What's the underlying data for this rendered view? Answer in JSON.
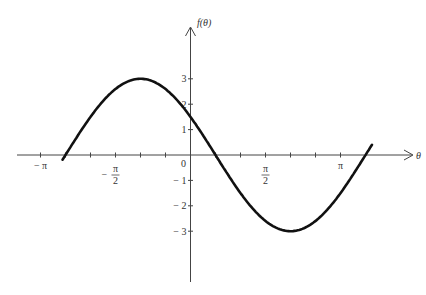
{
  "chart_data": {
    "type": "line",
    "title": "",
    "function": "f(θ) = 3cos(θ + π/3)",
    "xlabel": "θ",
    "ylabel": "f(θ)",
    "x_ticks": [
      {
        "value": -3.14159,
        "label": "−π"
      },
      {
        "value": -2.61799,
        "label": ""
      },
      {
        "value": -2.0944,
        "label": ""
      },
      {
        "value": -1.5708,
        "label": "−π/2"
      },
      {
        "value": -1.0472,
        "label": ""
      },
      {
        "value": -0.5236,
        "label": ""
      },
      {
        "value": 0.5236,
        "label": ""
      },
      {
        "value": 1.0472,
        "label": ""
      },
      {
        "value": 1.5708,
        "label": "π/2"
      },
      {
        "value": 2.0944,
        "label": ""
      },
      {
        "value": 2.61799,
        "label": ""
      },
      {
        "value": 3.14159,
        "label": "π"
      }
    ],
    "y_ticks": [
      {
        "value": 3,
        "label": "3"
      },
      {
        "value": 2,
        "label": "2"
      },
      {
        "value": 1,
        "label": "1"
      },
      {
        "value": -1,
        "label": "−1"
      },
      {
        "value": -2,
        "label": "−2"
      },
      {
        "value": -3,
        "label": "−3"
      }
    ],
    "origin_label": "0",
    "series": [
      {
        "name": "f(θ)",
        "amplitude": 3,
        "phase": 1.0472,
        "x_range": [
          -2.68,
          3.8
        ],
        "key_points": [
          {
            "x": -2.618,
            "y": 0
          },
          {
            "x": -1.0472,
            "y": 3
          },
          {
            "x": 0,
            "y": 1.5
          },
          {
            "x": 0.5236,
            "y": 0
          },
          {
            "x": 2.0944,
            "y": -3
          },
          {
            "x": 3.6652,
            "y": 0
          }
        ]
      }
    ],
    "xlim": [
      -3.6,
      4.8
    ],
    "ylim": [
      -5,
      5
    ],
    "grid": false,
    "legend": "none"
  }
}
